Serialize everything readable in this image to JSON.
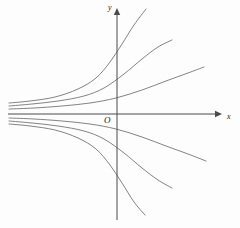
{
  "figure": {
    "background_color": "#fdfdfd",
    "curve_color": "#6d6d6d",
    "axis_color": "#4a4a4a",
    "label_color": "#1a1a1a"
  },
  "labels": {
    "y_axis": "y",
    "x_axis": "x",
    "origin": "O"
  },
  "chart_data": {
    "type": "line",
    "title": "",
    "subtitle": "",
    "xlabel": "x",
    "ylabel": "y",
    "grid": false,
    "legend": "none",
    "axes": {
      "x_axis_pixel_y": 114,
      "y_axis_pixel_x": 117,
      "x_axis_extent_px": [
        8,
        222
      ],
      "y_axis_extent_px": [
        8,
        220
      ],
      "x_arrow": true,
      "y_arrow": true,
      "xlim": [
        -5.2,
        3.0
      ],
      "ylim": [
        -3.0,
        3.0
      ]
    },
    "series": [
      {
        "name": "curve-upper-1",
        "comment": "steepest rising curve, exits top of frame",
        "points_px": [
          [
            9,
            103
          ],
          [
            30,
            101
          ],
          [
            55,
            97
          ],
          [
            78,
            89
          ],
          [
            96,
            78
          ],
          [
            110,
            62
          ],
          [
            122,
            44
          ],
          [
            134,
            25
          ],
          [
            146,
            9
          ]
        ]
      },
      {
        "name": "curve-upper-2",
        "comment": "second rising curve",
        "points_px": [
          [
            9,
            106
          ],
          [
            32,
            104
          ],
          [
            58,
            101
          ],
          [
            84,
            96
          ],
          [
            104,
            88
          ],
          [
            124,
            74
          ],
          [
            142,
            59
          ],
          [
            158,
            47
          ],
          [
            172,
            40
          ]
        ]
      },
      {
        "name": "curve-upper-3",
        "comment": "shallow rising curve nearest the axis",
        "points_px": [
          [
            9,
            109
          ],
          [
            34,
            108
          ],
          [
            62,
            106
          ],
          [
            90,
            103
          ],
          [
            116,
            98
          ],
          [
            142,
            90
          ],
          [
            166,
            81
          ],
          [
            188,
            73
          ],
          [
            204,
            67
          ]
        ]
      },
      {
        "name": "curve-lower-1",
        "comment": "shallow falling curve nearest the axis",
        "points_px": [
          [
            9,
            118
          ],
          [
            34,
            119
          ],
          [
            62,
            121
          ],
          [
            90,
            124
          ],
          [
            116,
            129
          ],
          [
            142,
            137
          ],
          [
            166,
            146
          ],
          [
            188,
            154
          ],
          [
            206,
            161
          ]
        ]
      },
      {
        "name": "curve-lower-2",
        "comment": "second falling curve",
        "points_px": [
          [
            9,
            121
          ],
          [
            32,
            123
          ],
          [
            58,
            126
          ],
          [
            84,
            131
          ],
          [
            104,
            139
          ],
          [
            124,
            153
          ],
          [
            142,
            168
          ],
          [
            158,
            180
          ],
          [
            172,
            188
          ]
        ]
      },
      {
        "name": "curve-lower-3",
        "comment": "steepest falling curve, exits bottom of frame",
        "points_px": [
          [
            9,
            124
          ],
          [
            30,
            126
          ],
          [
            55,
            130
          ],
          [
            78,
            138
          ],
          [
            96,
            149
          ],
          [
            110,
            165
          ],
          [
            122,
            183
          ],
          [
            134,
            202
          ],
          [
            145,
            215
          ]
        ]
      }
    ]
  }
}
